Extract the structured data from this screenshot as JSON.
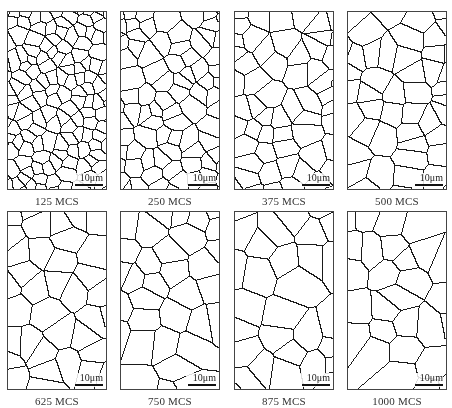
{
  "figure": {
    "scale_bar_label": "10μm",
    "boundary_color": "#1a1a1a",
    "background_color": "#ffffff",
    "panels": [
      {
        "label": "125 MCS",
        "grains": 150,
        "seed": 11
      },
      {
        "label": "250 MCS",
        "grains": 85,
        "seed": 23
      },
      {
        "label": "375 MCS",
        "grains": 58,
        "seed": 37
      },
      {
        "label": "500 MCS",
        "grains": 48,
        "seed": 41
      },
      {
        "label": "625 MCS",
        "grains": 36,
        "seed": 53
      },
      {
        "label": "750 MCS",
        "grains": 33,
        "seed": 67
      },
      {
        "label": "875 MCS",
        "grains": 30,
        "seed": 71
      },
      {
        "label": "1000 MCS",
        "grains": 28,
        "seed": 89
      }
    ]
  }
}
